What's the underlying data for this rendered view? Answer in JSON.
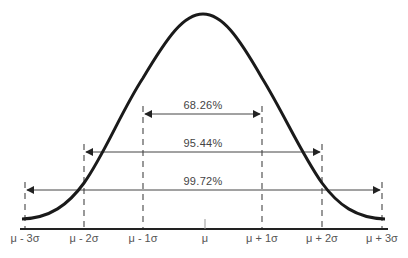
{
  "diagram": {
    "axis_labels": [
      "μ - 3σ",
      "μ - 2σ",
      "μ - 1σ",
      "μ",
      "μ + 1σ",
      "μ + 2σ",
      "μ + 3σ"
    ],
    "intervals": [
      {
        "label": "68.26%",
        "from": "μ - 1σ",
        "to": "μ + 1σ"
      },
      {
        "label": "95.44%",
        "from": "μ - 2σ",
        "to": "μ + 2σ"
      },
      {
        "label": "99.72%",
        "from": "μ - 3σ",
        "to": "μ + 3σ"
      }
    ],
    "colors": {
      "curve": "#1a1a1a",
      "axis": "#222222",
      "dashes": "#555555",
      "arrows": "#444444",
      "text": "#555555"
    }
  }
}
